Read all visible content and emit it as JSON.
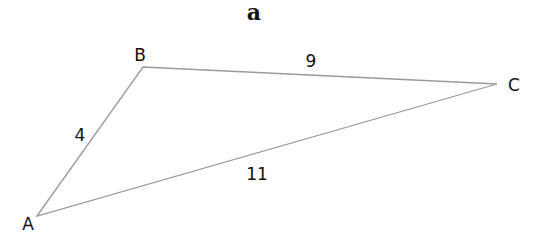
{
  "figure": {
    "label": "a"
  },
  "triangle": {
    "vertices": [
      {
        "name": "A",
        "x": 37,
        "y": 216,
        "label_x": 28,
        "label_y": 230
      },
      {
        "name": "B",
        "x": 143,
        "y": 67,
        "label_x": 140,
        "label_y": 61
      },
      {
        "name": "C",
        "x": 497,
        "y": 84,
        "label_x": 514,
        "label_y": 91
      }
    ],
    "sides": [
      {
        "name": "AB",
        "length": "4",
        "label_x": 80,
        "label_y": 141
      },
      {
        "name": "BC",
        "length": "9",
        "label_x": 311,
        "label_y": 67
      },
      {
        "name": "AC",
        "length": "11",
        "label_x": 257,
        "label_y": 180
      }
    ],
    "edge_color": "#9a9a9a"
  }
}
